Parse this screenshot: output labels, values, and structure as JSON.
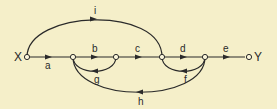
{
  "diagram": {
    "type": "signal-flow-graph",
    "background": "#f5efc9",
    "stroke_color": "#2a2a2a",
    "input_label": "X",
    "output_label": "Y",
    "nodes": [
      {
        "id": "X",
        "x": 27,
        "y": 57
      },
      {
        "id": "n1",
        "x": 73,
        "y": 57
      },
      {
        "id": "n2",
        "x": 116,
        "y": 57
      },
      {
        "id": "n3",
        "x": 162,
        "y": 57
      },
      {
        "id": "n4",
        "x": 205,
        "y": 57
      },
      {
        "id": "Y",
        "x": 249,
        "y": 57
      }
    ],
    "edges": [
      {
        "label": "a",
        "from": "X",
        "to": "n1"
      },
      {
        "label": "b",
        "from": "n1",
        "to": "n2"
      },
      {
        "label": "c",
        "from": "n2",
        "to": "n3"
      },
      {
        "label": "d",
        "from": "n3",
        "to": "n4"
      },
      {
        "label": "e",
        "from": "n4",
        "to": "Y"
      },
      {
        "label": "g",
        "from": "n2",
        "to": "n1"
      },
      {
        "label": "f",
        "from": "n4",
        "to": "n3"
      },
      {
        "label": "h",
        "from": "n4",
        "to": "n1"
      },
      {
        "label": "i",
        "from": "X",
        "to": "n3"
      }
    ]
  }
}
